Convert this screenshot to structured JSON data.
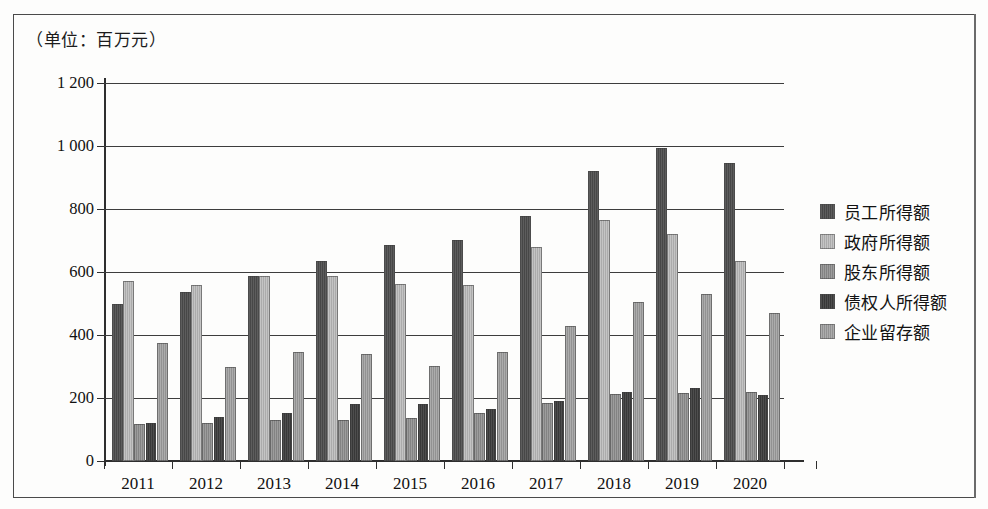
{
  "figure": {
    "units_caption": "（单位：百万元）"
  },
  "legend": {
    "position": "right",
    "items": [
      {
        "label": "员工所得额",
        "color": "#4b4b4b"
      },
      {
        "label": "政府所得额",
        "color": "#b4b4b4"
      },
      {
        "label": "股东所得额",
        "color": "#8a8a8a"
      },
      {
        "label": "债权人所得额",
        "color": "#3c3c3c"
      },
      {
        "label": "企业留存额",
        "color": "#9a9a9a"
      }
    ]
  },
  "chart_data": {
    "type": "bar",
    "title": "",
    "subtitle": "",
    "xlabel": "",
    "ylabel": "（单位：百万元）",
    "ylim": [
      0,
      1200
    ],
    "ytick_labels": [
      "0",
      "200",
      "400",
      "600",
      "800",
      "1 000",
      "1 200"
    ],
    "ytick_values": [
      0,
      200,
      400,
      600,
      800,
      1000,
      1200
    ],
    "grid": true,
    "legend_position": "right",
    "categories": [
      "2011",
      "2012",
      "2013",
      "2014",
      "2015",
      "2016",
      "2017",
      "2018",
      "2019",
      "2020"
    ],
    "series": [
      {
        "name": "员工所得额",
        "color": "#4b4b4b",
        "values": [
          500,
          535,
          588,
          635,
          685,
          703,
          778,
          922,
          995,
          945
        ]
      },
      {
        "name": "政府所得额",
        "color": "#b4b4b4",
        "values": [
          572,
          558,
          588,
          588,
          562,
          558,
          678,
          765,
          720,
          635
        ]
      },
      {
        "name": "股东所得额",
        "color": "#8a8a8a",
        "values": [
          118,
          122,
          130,
          130,
          135,
          152,
          185,
          213,
          215,
          220
        ]
      },
      {
        "name": "债权人所得额",
        "color": "#3c3c3c",
        "values": [
          120,
          140,
          152,
          182,
          180,
          165,
          190,
          220,
          232,
          208
        ]
      },
      {
        "name": "企业留存额",
        "color": "#9a9a9a",
        "values": [
          375,
          300,
          347,
          340,
          302,
          345,
          428,
          505,
          530,
          470
        ]
      }
    ]
  }
}
